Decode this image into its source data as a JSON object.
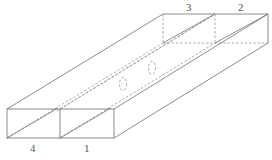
{
  "diagram": {
    "labels": {
      "front_left": "4",
      "front_right": "1",
      "back_left": "3",
      "back_right": "2"
    },
    "colors": {
      "line": "#6e6e6e",
      "hidden_line": "#8a8a8a",
      "background": "#ffffff"
    }
  }
}
